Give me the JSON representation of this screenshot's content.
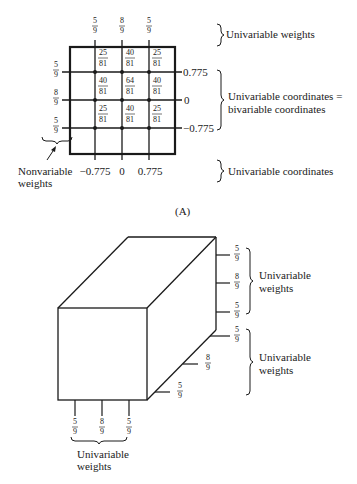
{
  "panel_a": {
    "label": "(A)",
    "top_weights": [
      {
        "num": "5",
        "den": "9"
      },
      {
        "num": "8",
        "den": "9"
      },
      {
        "num": "5",
        "den": "9"
      }
    ],
    "left_weights": [
      {
        "num": "5",
        "den": "9"
      },
      {
        "num": "8",
        "den": "9"
      },
      {
        "num": "5",
        "den": "9"
      }
    ],
    "cell_weights": [
      [
        {
          "num": "25",
          "den": "81"
        },
        {
          "num": "40",
          "den": "81"
        },
        {
          "num": "25",
          "den": "81"
        }
      ],
      [
        {
          "num": "40",
          "den": "81"
        },
        {
          "num": "64",
          "den": "81"
        },
        {
          "num": "40",
          "den": "81"
        }
      ],
      [
        {
          "num": "25",
          "den": "81"
        },
        {
          "num": "40",
          "den": "81"
        },
        {
          "num": "25",
          "den": "81"
        }
      ]
    ],
    "right_coords": [
      "0.775",
      "0",
      "−0.775"
    ],
    "bottom_coords": [
      "−0.775",
      "0",
      "0.775"
    ],
    "annotations": {
      "top": "Univariable weights",
      "right_line1": "Univariable coordinates =",
      "right_line2": "bivariable coordinates",
      "bottom": "Univariable coordinates",
      "nonvariable_line1": "Nonvariable",
      "nonvariable_line2": "weights"
    }
  },
  "panel_b": {
    "right_weights": [
      {
        "num": "5",
        "den": "9"
      },
      {
        "num": "8",
        "den": "9"
      },
      {
        "num": "5",
        "den": "9"
      }
    ],
    "depth_weights": [
      {
        "num": "5",
        "den": "9"
      },
      {
        "num": "8",
        "den": "9"
      },
      {
        "num": "5",
        "den": "9"
      }
    ],
    "bottom_weights": [
      {
        "num": "5",
        "den": "9"
      },
      {
        "num": "8",
        "den": "9"
      },
      {
        "num": "5",
        "den": "9"
      }
    ],
    "annotations": {
      "right_upper_line1": "Univariable",
      "right_upper_line2": "weights",
      "right_lower_line1": "Univariable",
      "right_lower_line2": "weights",
      "bottom_line1": "Univariable",
      "bottom_line2": "weights"
    }
  }
}
